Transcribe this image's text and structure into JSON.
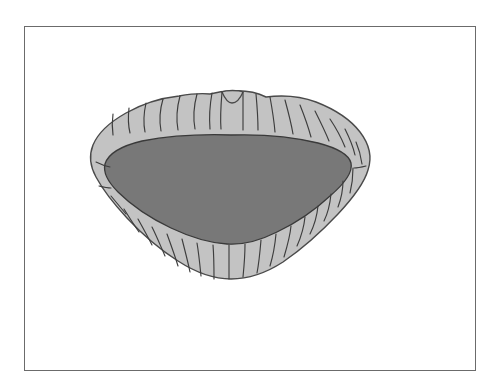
{
  "figure": {
    "style": "grayscale line drawing with flat tonal fills",
    "background_color": "#ffffff",
    "frame": {
      "name": "figure-border",
      "stroke_color": "#6b6b6b",
      "stroke_width": 1,
      "x": 24,
      "y": 26,
      "width": 452,
      "height": 345
    },
    "colors": {
      "outer_lip_fill": "#c3c3c3",
      "outer_lip_stroke": "#4a4a4a",
      "inner_mouth_fill": "#787878",
      "inner_mouth_stroke": "#3a3a3a",
      "crease_stroke": "#3d3d3d",
      "background": "#ffffff"
    },
    "shape_bounds": {
      "left": 90,
      "right": 371,
      "top": 89,
      "bottom": 279,
      "center_x": 231,
      "center_y": 184
    },
    "features": [
      {
        "name": "cupid-bow-notch",
        "x": 232,
        "y": 92
      },
      {
        "name": "left-mouth-corner",
        "x": 97,
        "y": 178
      },
      {
        "name": "right-mouth-corner",
        "x": 366,
        "y": 172
      },
      {
        "name": "lower-lip-apex",
        "x": 229,
        "y": 278
      }
    ],
    "labels": {
      "caption": "",
      "note": ""
    }
  }
}
